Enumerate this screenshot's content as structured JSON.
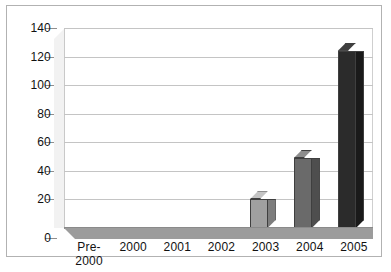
{
  "chart_data": {
    "type": "bar",
    "title": "",
    "subtitle": "",
    "xlabel": "",
    "ylabel": "",
    "categories": [
      "Pre-2000",
      "2000",
      "2001",
      "2002",
      "2003",
      "2004",
      "2005"
    ],
    "category_lines": [
      [
        "Pre-",
        "2000"
      ],
      [
        "2000"
      ],
      [
        "2001"
      ],
      [
        "2002"
      ],
      [
        "2003"
      ],
      [
        "2004"
      ],
      [
        "2005"
      ]
    ],
    "values": [
      0,
      0,
      0,
      0,
      20,
      49,
      124
    ],
    "bar_colors": [
      "#a0a0a0",
      "#a0a0a0",
      "#a0a0a0",
      "#a0a0a0",
      "#a0a0a0",
      "#6a6a6a",
      "#2b2b2b"
    ],
    "bar_side_colors": [
      "#7d7d7d",
      "#7d7d7d",
      "#7d7d7d",
      "#7d7d7d",
      "#7d7d7d",
      "#4e4e4e",
      "#1a1a1a"
    ],
    "bar_top_colors": [
      "#c4c4c4",
      "#c4c4c4",
      "#c4c4c4",
      "#c4c4c4",
      "#c4c4c4",
      "#8d8d8d",
      "#3f3f3f"
    ],
    "ylim": [
      0,
      140
    ],
    "yticks": [
      0,
      20,
      40,
      60,
      80,
      100,
      120,
      140
    ],
    "ytick_labels": [
      "0",
      "20",
      "40",
      "60",
      "80",
      "100",
      "120",
      "140"
    ],
    "grid": true,
    "grid_axis": "y",
    "legend": false,
    "legend_position": "none",
    "style": "3d-column",
    "plot_background": "#ffffff",
    "grid_color": "#c4c4c4",
    "axis_color": "#8a8a8a",
    "frame_color": "#b2b2b2"
  }
}
